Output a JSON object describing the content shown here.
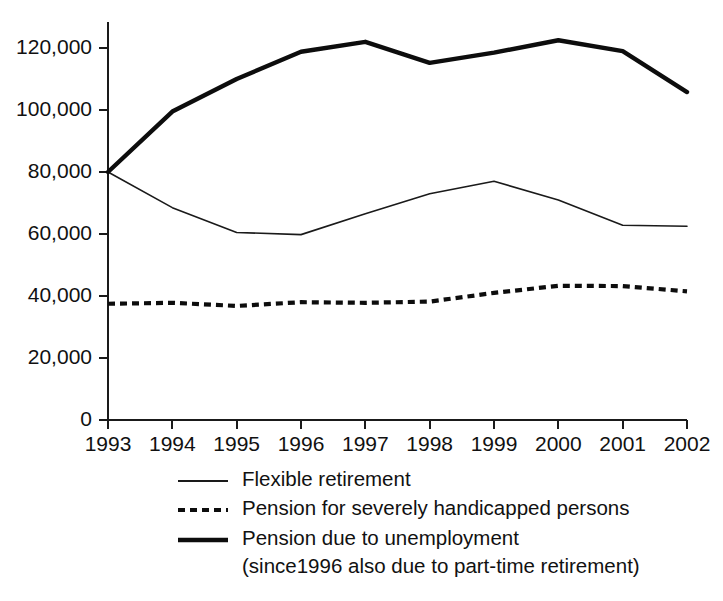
{
  "chart_data": {
    "type": "line",
    "title": "",
    "subtitle": "",
    "xlabel": "",
    "ylabel": "",
    "x": [
      1993,
      1994,
      1995,
      1996,
      1997,
      1998,
      1999,
      2000,
      2001,
      2002
    ],
    "categories": [
      "1993",
      "1994",
      "1995",
      "1996",
      "1997",
      "1998",
      "1999",
      "2000",
      "2001",
      "2002"
    ],
    "xlim": [
      1993,
      2002
    ],
    "ylim": [
      0,
      130000
    ],
    "yticks": [
      0,
      20000,
      40000,
      60000,
      80000,
      100000,
      120000
    ],
    "ytick_labels": [
      "0",
      "20,000",
      "40,000",
      "60,000",
      "80,000",
      "100,000",
      "120,000"
    ],
    "grid": false,
    "legend_position": "bottom",
    "series": [
      {
        "name": "Flexible retirement",
        "style": "thin-solid",
        "color": "#1a1a1a",
        "values": [
          80000,
          68500,
          60500,
          59800,
          66500,
          73000,
          77000,
          71000,
          62800,
          62500
        ]
      },
      {
        "name": "Pension for severely handicapped persons",
        "style": "dashed",
        "color": "#0d0d0d",
        "values": [
          37500,
          37800,
          36800,
          38000,
          37800,
          38200,
          41000,
          43300,
          43200,
          41500
        ]
      },
      {
        "name": "Pension due to unemployment",
        "style": "thick-solid",
        "color": "#0d0d0d",
        "values": [
          80000,
          99500,
          110000,
          118800,
          122000,
          115200,
          118500,
          122500,
          119000,
          105800
        ]
      }
    ]
  },
  "axes": {
    "ytick_labels": [
      "120,000",
      "100,000",
      "80,000",
      "60,000",
      "40,000",
      "20,000",
      "0"
    ],
    "xtick_labels": [
      "1993",
      "1994",
      "1995",
      "1996",
      "1997",
      "1998",
      "1999",
      "2000",
      "2001",
      "2002"
    ]
  },
  "legend": {
    "entries": [
      {
        "sample": "thin-solid-line-icon",
        "label": "Flexible retirement",
        "label2": ""
      },
      {
        "sample": "dashed-line-icon",
        "label": "Pension for severely handicapped persons",
        "label2": ""
      },
      {
        "sample": "thick-solid-line-icon",
        "label": "Pension due to unemployment",
        "label2": "(since1996 also due to part-time retirement)"
      }
    ]
  },
  "colors": {
    "background": "#ffffff",
    "ink": "#111111",
    "axis": "#1a1a1a"
  }
}
